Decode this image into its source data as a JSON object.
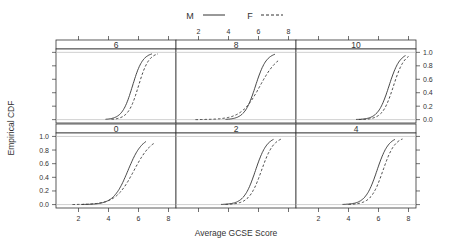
{
  "chart_data": {
    "type": "line",
    "subtype": "empirical-cdf-trellis",
    "xlabel": "Average GCSE Score",
    "ylabel": "Empirical CDF",
    "xticks": [
      "2",
      "4",
      "6",
      "8"
    ],
    "yticks": [
      "0.0",
      "0.2",
      "0.4",
      "0.6",
      "0.8",
      "1.0"
    ],
    "xlim": [
      0.5,
      8.5
    ],
    "ylim": [
      -0.05,
      1.05
    ],
    "legend": {
      "position": "top",
      "entries": [
        {
          "name": "M",
          "style": "solid"
        },
        {
          "name": "F",
          "style": "dashed"
        }
      ]
    },
    "panels": [
      {
        "label": "6",
        "row": "top",
        "col": 0,
        "M": {
          "start": 3.8,
          "mid": 5.6,
          "end": 6.9
        },
        "F": {
          "start": 4.2,
          "mid": 6.0,
          "end": 7.3
        }
      },
      {
        "label": "8",
        "row": "top",
        "col": 1,
        "M": {
          "start": 3.8,
          "mid": 5.8,
          "end": 7.1
        },
        "F": {
          "start": 1.8,
          "mid": 6.1,
          "end": 7.4
        }
      },
      {
        "label": "10",
        "row": "top",
        "col": 2,
        "M": {
          "start": 4.5,
          "mid": 6.7,
          "end": 7.8
        },
        "F": {
          "start": 4.7,
          "mid": 7.0,
          "end": 8.0
        }
      },
      {
        "label": "0",
        "row": "bottom",
        "col": 0,
        "M": {
          "start": 2.2,
          "mid": 5.3,
          "end": 6.5
        },
        "F": {
          "start": 1.6,
          "mid": 5.7,
          "end": 7.1
        }
      },
      {
        "label": "2",
        "row": "bottom",
        "col": 1,
        "M": {
          "start": 3.5,
          "mid": 5.8,
          "end": 7.0
        },
        "F": {
          "start": 3.8,
          "mid": 6.2,
          "end": 7.5
        }
      },
      {
        "label": "4",
        "row": "bottom",
        "col": 2,
        "M": {
          "start": 3.6,
          "mid": 5.9,
          "end": 7.1
        },
        "F": {
          "start": 4.0,
          "mid": 6.3,
          "end": 7.6
        }
      }
    ]
  }
}
